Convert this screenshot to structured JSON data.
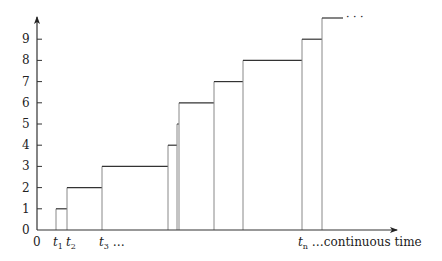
{
  "diagram": {
    "type": "step-function",
    "y_axis": {
      "ticks": [
        "0",
        "1",
        "2",
        "3",
        "4",
        "5",
        "6",
        "7",
        "8",
        "9"
      ]
    },
    "x_axis": {
      "origin_label": "0",
      "labels": [
        {
          "id": "t1",
          "base": "t",
          "sub": "1"
        },
        {
          "id": "t2",
          "base": "t",
          "sub": "2"
        },
        {
          "id": "t3",
          "base": "t",
          "sub": "3",
          "suffix": " …"
        },
        {
          "id": "tn",
          "base": "t",
          "sub": "n",
          "suffix": " …continuous time"
        }
      ]
    },
    "steps": [
      {
        "x_start": 56,
        "x_end": 67,
        "level": 1
      },
      {
        "x_start": 67,
        "x_end": 102,
        "level": 2
      },
      {
        "x_start": 102,
        "x_end": 168,
        "level": 3
      },
      {
        "x_start": 168,
        "x_end": 177,
        "level": 4
      },
      {
        "x_start": 177,
        "x_end": 179,
        "level": 5
      },
      {
        "x_start": 179,
        "x_end": 214,
        "level": 6
      },
      {
        "x_start": 214,
        "x_end": 243,
        "level": 7
      },
      {
        "x_start": 243,
        "x_end": 302,
        "level": 8
      },
      {
        "x_start": 302,
        "x_end": 322,
        "level": 9
      },
      {
        "x_start": 322,
        "x_end": 343,
        "level": 10
      }
    ],
    "continuation": "· · ·",
    "colors": {
      "axis": "#333333",
      "step_top": "#333333",
      "step_side": "#888888"
    }
  }
}
